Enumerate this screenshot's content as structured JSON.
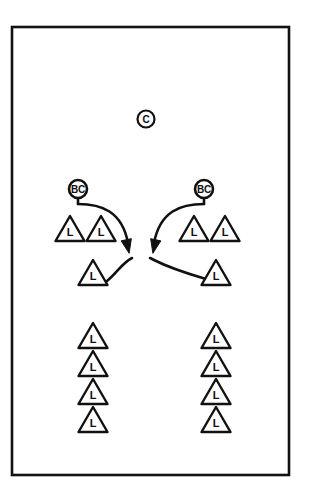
{
  "figure": {
    "background_color": "#ffffff",
    "stroke_color": "#111111",
    "frame": {
      "name": "diagram-border",
      "x": 12,
      "y": 27,
      "width": 277,
      "height": 448,
      "stroke_width": 2.6
    }
  },
  "nodes": {
    "command": {
      "label": "C",
      "cx": 146,
      "cy": 119,
      "r": 8.5,
      "shape": "circle",
      "stem": false
    },
    "bc_left": {
      "label": "BC",
      "cx": 78,
      "cy": 189,
      "r": 9,
      "shape": "circle",
      "stem": true,
      "stem_to_y": 204
    },
    "bc_right": {
      "label": "BC",
      "cx": 204,
      "cy": 189,
      "r": 9,
      "shape": "circle",
      "stem": true,
      "stem_to_y": 204
    }
  },
  "triangles": {
    "label": "L",
    "width": 29,
    "height": 25,
    "left_pair": [
      {
        "cx": 70,
        "base_y": 241
      },
      {
        "cx": 101,
        "base_y": 241
      }
    ],
    "right_pair": [
      {
        "cx": 194,
        "base_y": 241
      },
      {
        "cx": 225,
        "base_y": 241
      }
    ],
    "left_middle": [
      {
        "cx": 93,
        "base_y": 285
      }
    ],
    "right_middle": [
      {
        "cx": 216,
        "base_y": 285
      }
    ],
    "left_column": [
      {
        "cx": 93,
        "base_y": 348
      },
      {
        "cx": 93,
        "base_y": 376
      },
      {
        "cx": 93,
        "base_y": 404
      },
      {
        "cx": 93,
        "base_y": 432
      }
    ],
    "right_column": [
      {
        "cx": 216,
        "base_y": 348
      },
      {
        "cx": 216,
        "base_y": 376
      },
      {
        "cx": 216,
        "base_y": 404
      },
      {
        "cx": 216,
        "base_y": 432
      }
    ]
  },
  "arrows": {
    "stroke_width": 2.6,
    "left_sweep": {
      "name": "arrow-left-sweep",
      "path": "M 78 204 C 101 204, 122 211, 128 243",
      "head_at": [
        128,
        248
      ],
      "head_angle": 78
    },
    "right_sweep": {
      "name": "arrow-right-sweep",
      "path": "M 204 204 C 181 204, 160 211, 154 243",
      "head_at": [
        154,
        248
      ],
      "head_angle": 102
    },
    "left_tail": {
      "name": "connector-left-tail",
      "path": "M 107 281 C 117 273, 122 263, 132 258"
    },
    "right_tail": {
      "name": "connector-right-tail",
      "path": "M 150 258 C 160 263, 168 268, 206 279"
    }
  },
  "legend_text": {
    "triangle_symbol": "L",
    "command_symbol": "C",
    "battery_commander_symbol": "BC"
  }
}
